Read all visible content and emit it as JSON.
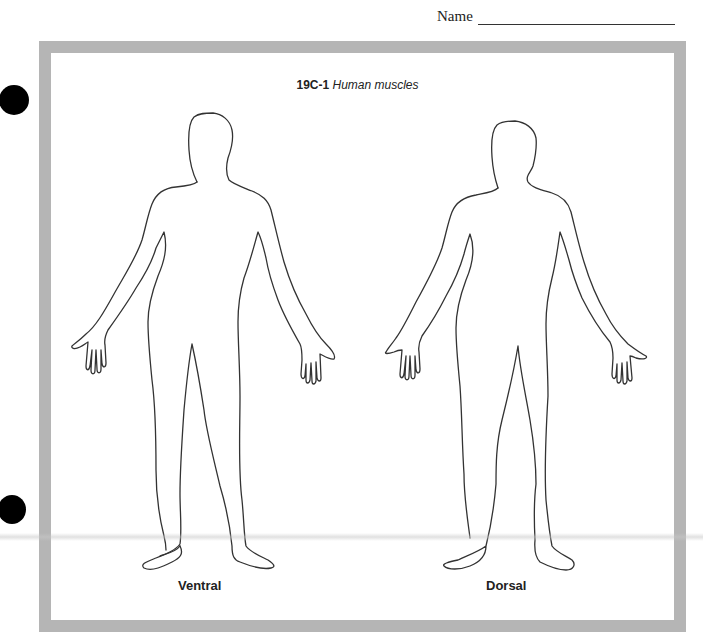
{
  "header": {
    "name_label": "Name"
  },
  "worksheet": {
    "figure_number": "19C-1",
    "figure_title": "Human muscles",
    "figures": [
      {
        "id": "ventral",
        "label": "Ventral"
      },
      {
        "id": "dorsal",
        "label": "Dorsal"
      }
    ]
  },
  "colors": {
    "frame": "#b5b5b5",
    "outline": "#333333",
    "hole": "#000000"
  }
}
